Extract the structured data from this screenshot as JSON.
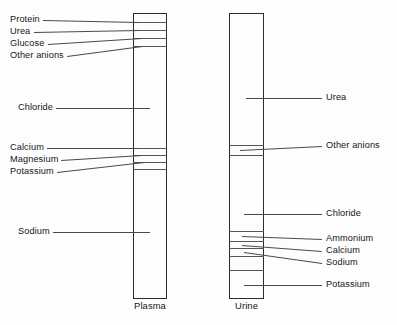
{
  "figure": {
    "background_color": "#fdfdfd",
    "line_color": "#555555",
    "box_border_color": "#2b2b2b",
    "text_color": "#161616"
  },
  "chart_data": {
    "type": "bar",
    "xlabel": "",
    "ylabel": "",
    "grid": false,
    "legend_position": "none",
    "orientation": "vertical-stacked",
    "categories": [
      "Plasma",
      "Urine"
    ],
    "series": [
      {
        "name": "Plasma",
        "components": [
          "Protein",
          "Urea",
          "Glucose",
          "Other anions",
          "Chloride",
          "Calcium",
          "Magnesium",
          "Potassium",
          "Sodium"
        ]
      },
      {
        "name": "Urine",
        "components": [
          "Urea",
          "Other anions",
          "Chloride",
          "Ammonium",
          "Calcium",
          "Sodium",
          "Potassium"
        ]
      }
    ]
  },
  "columns": [
    {
      "id": "plasma",
      "caption": "Plasma",
      "x": 133,
      "y": 13,
      "width": 34,
      "height": 286,
      "bands": [
        {
          "y": 22
        },
        {
          "y": 30
        },
        {
          "y": 38
        },
        {
          "y": 46
        },
        {
          "y": 148
        },
        {
          "y": 155
        },
        {
          "y": 162
        },
        {
          "y": 169
        }
      ]
    },
    {
      "id": "urine",
      "caption": "Urine",
      "x": 229,
      "y": 13,
      "width": 35,
      "height": 286,
      "bands": [
        {
          "y": 145
        },
        {
          "y": 155
        },
        {
          "y": 231
        },
        {
          "y": 241
        },
        {
          "y": 248
        },
        {
          "y": 256
        },
        {
          "y": 270
        }
      ]
    }
  ],
  "labels_left": [
    {
      "text": "Protein",
      "x": 10,
      "y": 20,
      "leader_to_x": 139,
      "leader_to_y": 22
    },
    {
      "text": "Urea",
      "x": 10,
      "y": 32,
      "leader_to_x": 139,
      "leader_to_y": 30
    },
    {
      "text": "Glucose",
      "x": 10,
      "y": 44,
      "leader_to_x": 142,
      "leader_to_y": 38
    },
    {
      "text": "Other anions",
      "x": 10,
      "y": 56,
      "leader_to_x": 142,
      "leader_to_y": 46
    },
    {
      "text": "Chloride",
      "x": 18,
      "y": 108,
      "leader_to_x": 150,
      "leader_to_y": 108
    },
    {
      "text": "Calcium",
      "x": 10,
      "y": 148,
      "leader_to_x": 140,
      "leader_to_y": 148
    },
    {
      "text": "Magnesium",
      "x": 10,
      "y": 160,
      "leader_to_x": 142,
      "leader_to_y": 155
    },
    {
      "text": "Potassium",
      "x": 10,
      "y": 172,
      "leader_to_x": 144,
      "leader_to_y": 162
    },
    {
      "text": "Sodium",
      "x": 18,
      "y": 232,
      "leader_to_x": 150,
      "leader_to_y": 232
    }
  ],
  "labels_right": [
    {
      "text": "Other anions",
      "x": 326,
      "y": 146,
      "leader_from_x": 240,
      "leader_from_y": 150
    },
    {
      "text": "Urea",
      "x": 326,
      "y": 98,
      "leader_from_x": 246,
      "leader_from_y": 98
    },
    {
      "text": "Chloride",
      "x": 326,
      "y": 214,
      "leader_from_x": 244,
      "leader_from_y": 214
    },
    {
      "text": "Ammonium",
      "x": 326,
      "y": 239,
      "leader_from_x": 242,
      "leader_from_y": 236
    },
    {
      "text": "Calcium",
      "x": 326,
      "y": 251,
      "leader_from_x": 242,
      "leader_from_y": 245
    },
    {
      "text": "Sodium",
      "x": 326,
      "y": 263,
      "leader_from_x": 244,
      "leader_from_y": 252
    },
    {
      "text": "Potassium",
      "x": 326,
      "y": 285,
      "leader_from_x": 244,
      "leader_from_y": 285
    }
  ],
  "captions": [
    {
      "text": "Plasma",
      "x": 133,
      "y": 301,
      "width": 34
    },
    {
      "text": "Urine",
      "x": 229,
      "y": 301,
      "width": 35
    }
  ]
}
